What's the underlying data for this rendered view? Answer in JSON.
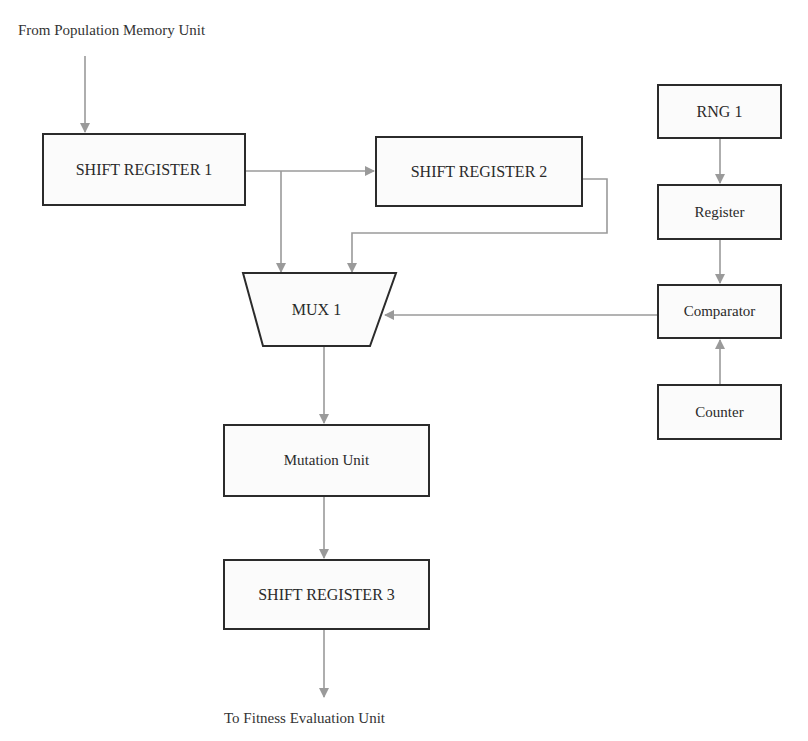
{
  "diagram": {
    "input_label": "From Population Memory Unit",
    "output_label": "To Fitness Evaluation Unit",
    "blocks": {
      "shift_register_1": "SHIFT REGISTER 1",
      "shift_register_2": "SHIFT REGISTER 2",
      "mux_1": "MUX 1",
      "mutation_unit": "Mutation Unit",
      "shift_register_3": "SHIFT REGISTER 3",
      "rng_1": "RNG 1",
      "register": "Register",
      "comparator": "Comparator",
      "counter": "Counter"
    },
    "connections": [
      {
        "from": "From Population Memory Unit",
        "to": "SHIFT REGISTER 1"
      },
      {
        "from": "SHIFT REGISTER 1",
        "to": "SHIFT REGISTER 2"
      },
      {
        "from": "SHIFT REGISTER 1",
        "to": "MUX 1"
      },
      {
        "from": "SHIFT REGISTER 2",
        "to": "MUX 1"
      },
      {
        "from": "RNG 1",
        "to": "Register"
      },
      {
        "from": "Register",
        "to": "Comparator"
      },
      {
        "from": "Counter",
        "to": "Comparator"
      },
      {
        "from": "Comparator",
        "to": "MUX 1"
      },
      {
        "from": "MUX 1",
        "to": "Mutation Unit"
      },
      {
        "from": "Mutation Unit",
        "to": "SHIFT REGISTER 3"
      },
      {
        "from": "SHIFT REGISTER 3",
        "to": "To Fitness Evaluation Unit"
      }
    ],
    "colors": {
      "block_border": "#2b2b2b",
      "connector": "#9a9a9a",
      "text": "#2a2a2a"
    }
  }
}
